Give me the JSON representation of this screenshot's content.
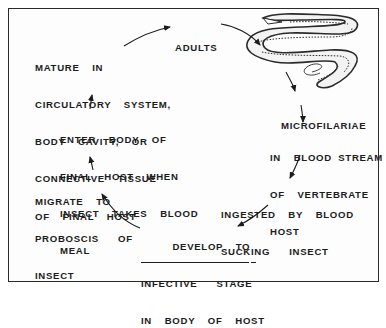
{
  "diagram": {
    "type": "life-cycle",
    "stages": [
      {
        "id": "adults",
        "lines": [
          "ADULTS"
        ]
      },
      {
        "id": "microfilariae",
        "lines": [
          "MICROFILARIAE"
        ]
      },
      {
        "id": "blood-stream",
        "lines": [
          "IN  BLOOD STREAM",
          "OF  VERTEBRATE",
          "HOST"
        ]
      },
      {
        "id": "ingested",
        "lines": [
          "INGESTED  BY  BLOOD",
          "SUCKING   INSECT"
        ]
      },
      {
        "id": "develop",
        "lines": [
          "DEVELOP  TO",
          "INFECTIVE   STAGE",
          "IN  BODY  OF  HOST"
        ]
      },
      {
        "id": "migrate",
        "lines": [
          "MIGRATE  TO",
          "PROBOSCIS   OF",
          "INSECT"
        ]
      },
      {
        "id": "enter",
        "lines": [
          "ENTER  BODY  OF",
          "FINAL  HOST  WHEN",
          "INSECT  TAKES  BLOOD",
          "MEAL"
        ]
      },
      {
        "id": "mature",
        "lines": [
          "MATURE  IN",
          "CIRCULATORY  SYSTEM,",
          "BODY  CAVITY,  OR",
          "CONNECTIVE  TISSUE",
          "OF  FINAL  HOST"
        ]
      }
    ],
    "illustration": "adult-worm-drawing",
    "colors": {
      "ink": "#1c1c1c",
      "paper": "#fdfdfd",
      "border": "#2a2a2a"
    }
  }
}
